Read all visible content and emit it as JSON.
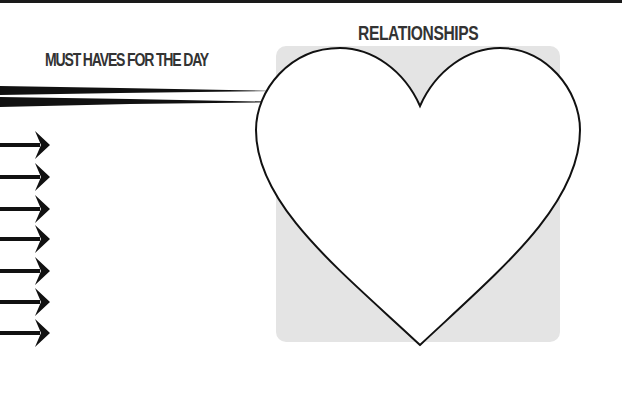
{
  "page": {
    "top_rule": "dark-bar",
    "colors": {
      "text": "#333333",
      "ink": "#111111",
      "box_fill": "#e4e4e4",
      "heart_fill": "#ffffff"
    }
  },
  "left_section": {
    "title": "MUST HAVES FOR THE DAY",
    "decoration": "brush-strokes",
    "arrow_icon": "right-arrow-icon",
    "arrow_count": 7,
    "items": [
      "",
      "",
      "",
      "",
      "",
      "",
      ""
    ]
  },
  "right_section": {
    "title": "RELATIONSHIPS",
    "shape_icon": "heart-icon",
    "content": ""
  }
}
